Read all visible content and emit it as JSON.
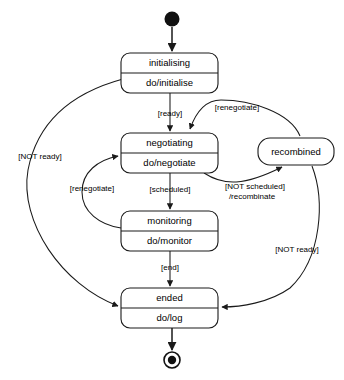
{
  "diagram": {
    "type": "uml-state-machine-diagram",
    "title": "",
    "background_color": "#ffffff",
    "line_color": "#1a1a1a",
    "text_color": "#000000",
    "initial_state": {
      "name": "initial-pseudostate",
      "shape": "filled-circle",
      "cx": 172,
      "cy": 19,
      "r": 7.5
    },
    "final_state": {
      "name": "final-state",
      "shape": "bullseye",
      "cx": 172,
      "cy": 360,
      "r_outer": 8,
      "r_inner": 4
    },
    "states": [
      {
        "id": "initialising",
        "name": "initialising",
        "activity": "do/initialise",
        "x": 121,
        "y": 53,
        "w": 97,
        "h": 40,
        "divider_y": 73,
        "compartments": 2
      },
      {
        "id": "negotiating",
        "name": "negotiating",
        "activity": "do/negotiate",
        "x": 121,
        "y": 133,
        "w": 97,
        "h": 40,
        "divider_y": 153,
        "compartments": 2
      },
      {
        "id": "recombined",
        "name": "recombined",
        "activity": "",
        "x": 258,
        "y": 138,
        "w": 76,
        "h": 27,
        "divider_y": 0,
        "compartments": 1
      },
      {
        "id": "monitoring",
        "name": "monitoring",
        "activity": "do/monitor",
        "x": 121,
        "y": 211,
        "w": 97,
        "h": 40,
        "divider_y": 231,
        "compartments": 2
      },
      {
        "id": "ended",
        "name": "ended",
        "activity": "do/log",
        "x": 121,
        "y": 288,
        "w": 97,
        "h": 40,
        "divider_y": 308,
        "compartments": 2
      }
    ],
    "transitions": [
      {
        "id": "start-to-initialising",
        "from": "initial-pseudostate",
        "to": "initialising",
        "label": "",
        "label_x": 0,
        "label_y": 0
      },
      {
        "id": "initialising-to-negotiating",
        "from": "initialising",
        "to": "negotiating",
        "label": "[ready]",
        "label_x": 170,
        "label_y": 114
      },
      {
        "id": "initialising-to-ended",
        "from": "initialising",
        "to": "ended",
        "label": "[NOT ready]",
        "label_x": 40,
        "label_y": 157
      },
      {
        "id": "negotiating-to-monitoring",
        "from": "negotiating",
        "to": "monitoring",
        "label": "[scheduled]",
        "label_x": 170,
        "label_y": 190
      },
      {
        "id": "negotiating-to-recombined",
        "from": "negotiating",
        "to": "recombined",
        "label_line1": "[NOT scheduled]",
        "label_line2": "/recombinate",
        "label_x": 255,
        "label_y": 187,
        "label2_x": 252,
        "label2_y": 197
      },
      {
        "id": "recombined-to-negotiating",
        "from": "recombined",
        "to": "negotiating",
        "label": "[renegotiate]",
        "label_x": 235,
        "label_y": 108
      },
      {
        "id": "recombined-to-ended",
        "from": "recombined",
        "to": "ended",
        "label": "[NOT ready]",
        "label_x": 297,
        "label_y": 250
      },
      {
        "id": "monitoring-to-negotiating",
        "from": "monitoring",
        "to": "negotiating",
        "label": "[renegotiate]",
        "label_x": 92,
        "label_y": 189
      },
      {
        "id": "monitoring-to-ended",
        "from": "monitoring",
        "to": "ended",
        "label": "[end]",
        "label_x": 170,
        "label_y": 268
      },
      {
        "id": "ended-to-final",
        "from": "ended",
        "to": "final-state",
        "label": "",
        "label_x": 0,
        "label_y": 0
      }
    ]
  }
}
